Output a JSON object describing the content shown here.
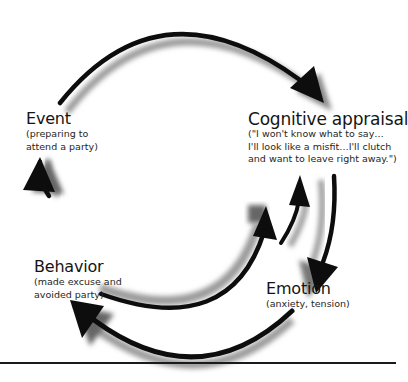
{
  "diagram": {
    "type": "cycle",
    "nodes": [
      {
        "id": "event",
        "title": "Event",
        "lines": [
          "(preparing to",
          "attend a party)"
        ]
      },
      {
        "id": "cognitive_appraisal",
        "title": "Cognitive appraisal",
        "lines": [
          "(\"I won't know what to say…",
          "I'll look like a misfit…I'll clutch",
          "and want to leave right away.\")"
        ]
      },
      {
        "id": "emotion",
        "title": "Emotion",
        "lines": [
          "(anxiety, tension)"
        ]
      },
      {
        "id": "behavior",
        "title": "Behavior",
        "lines": [
          "(made excuse and",
          "avoided party)"
        ]
      }
    ],
    "edges": [
      {
        "from": "event",
        "to": "cognitive_appraisal"
      },
      {
        "from": "cognitive_appraisal",
        "to": "emotion"
      },
      {
        "from": "emotion",
        "to": "cognitive_appraisal"
      },
      {
        "from": "behavior",
        "to": "cognitive_appraisal"
      },
      {
        "from": "emotion",
        "to": "behavior"
      },
      {
        "from": "behavior",
        "to": "event"
      }
    ],
    "colors": {
      "arrow": "#0d0d0d",
      "shadow": "#9a9a9a",
      "text": "#1a1a1a",
      "background": "#ffffff"
    }
  }
}
